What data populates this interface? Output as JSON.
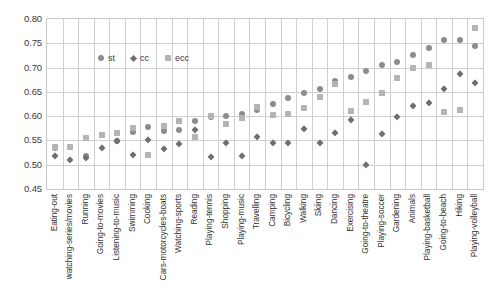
{
  "chart_data": {
    "type": "scatter",
    "title": "",
    "xlabel": "",
    "ylabel": "",
    "ylim": [
      0.45,
      0.8
    ],
    "ytick_labels": [
      "0.80",
      "0.75",
      "0.70",
      "0.65",
      "0.60",
      "0.55",
      "0.50",
      "0.45"
    ],
    "ytick_values": [
      0.8,
      0.75,
      0.7,
      0.65,
      0.6,
      0.55,
      0.5,
      0.45
    ],
    "grid": true,
    "legend_position": "upper-left-inside",
    "categories": [
      "Eating-out",
      "watching-series/movies",
      "Running",
      "Going-to-movies",
      "Listening-to-music",
      "Swimming",
      "Cooking",
      "Cars-motorcycles-boats",
      "Watching-sports",
      "Reading",
      "Playing-tennis",
      "Shopping",
      "Playing-music",
      "Travelling",
      "Camping",
      "Bicycling",
      "Walking",
      "Skiing",
      "Dancing",
      "Exercising",
      "Going-to-theatre",
      "Playing-soccer",
      "Gardening",
      "Animals",
      "Playing-basketball",
      "Going-to-beach",
      "Hiking",
      "Playing-volleyball"
    ],
    "series": [
      {
        "name": "st",
        "marker": "circle",
        "color": "#8c8c8c",
        "values": [
          0.534,
          0.536,
          0.517,
          0.562,
          0.549,
          0.567,
          0.578,
          0.57,
          0.572,
          0.591,
          0.598,
          0.601,
          0.604,
          0.612,
          0.625,
          0.638,
          0.648,
          0.655,
          0.672,
          0.681,
          0.692,
          0.706,
          0.712,
          0.725,
          0.741,
          0.757,
          0.757,
          0.745
        ]
      },
      {
        "name": "cc",
        "marker": "diamond",
        "color": "#6f6f6f",
        "values": [
          0.518,
          0.509,
          0.514,
          0.534,
          0.548,
          0.519,
          0.551,
          0.532,
          0.543,
          0.571,
          0.515,
          0.544,
          0.517,
          0.557,
          0.544,
          0.545,
          0.574,
          0.545,
          0.565,
          0.592,
          0.5,
          0.564,
          0.599,
          0.62,
          0.628,
          0.656,
          0.686,
          0.668
        ]
      },
      {
        "name": "ecc",
        "marker": "square",
        "color": "#b4b4b4",
        "values": [
          0.536,
          0.537,
          0.556,
          0.561,
          0.566,
          0.575,
          0.519,
          0.58,
          0.59,
          0.557,
          0.6,
          0.583,
          0.597,
          0.618,
          0.603,
          0.605,
          0.617,
          0.64,
          0.666,
          0.61,
          0.629,
          0.648,
          0.678,
          0.7,
          0.705,
          0.608,
          0.612,
          0.781
        ]
      }
    ]
  },
  "legend": {
    "items": [
      {
        "label": "st"
      },
      {
        "label": "cc"
      },
      {
        "label": "ecc"
      }
    ]
  }
}
